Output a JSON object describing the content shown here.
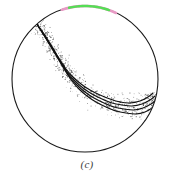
{
  "figure": {
    "caption": "(c)",
    "type": "stereographic-pole-figure",
    "background_color": "#ffffff"
  },
  "boundary_circle": {
    "name": "primitive-circle",
    "center_x": 85,
    "center_y": 79,
    "radius": 73,
    "stroke_color": "#1a1a1a",
    "stroke_width": 1.1,
    "fill_color": "#ffffff"
  },
  "highlight_arc": {
    "name": "top-highlight",
    "green_color": "#55dd55",
    "pink_color": "#e79ac4",
    "start_x": 62,
    "end_x": 116,
    "y": 5.5,
    "stroke_width": 2.4
  },
  "chart_data": {
    "type": "scatter",
    "title": "",
    "subtitle": "",
    "xlabel": "",
    "ylabel": "",
    "grid": false,
    "legend": null,
    "annotations": [
      "(c)"
    ],
    "xlim": [
      12,
      158
    ],
    "ylim": [
      6,
      152
    ],
    "series": [
      {
        "name": "band-1-upper",
        "kind": "line",
        "color": "#111111",
        "width": 1.15,
        "points": [
          [
            31,
            17
          ],
          [
            36,
            23
          ],
          [
            42,
            31
          ],
          [
            48,
            40
          ],
          [
            54,
            50
          ],
          [
            60,
            60
          ],
          [
            66,
            69
          ],
          [
            73,
            77
          ],
          [
            81,
            84
          ],
          [
            90,
            90
          ],
          [
            100,
            95
          ],
          [
            110,
            99
          ],
          [
            120,
            102
          ],
          [
            130,
            103
          ],
          [
            140,
            101
          ],
          [
            148,
            97
          ],
          [
            153,
            93
          ]
        ]
      },
      {
        "name": "band-2",
        "kind": "line",
        "color": "#111111",
        "width": 1.15,
        "points": [
          [
            33,
            19
          ],
          [
            38,
            26
          ],
          [
            44,
            35
          ],
          [
            50,
            44
          ],
          [
            56,
            54
          ],
          [
            62,
            64
          ],
          [
            68,
            73
          ],
          [
            75,
            81
          ],
          [
            83,
            88
          ],
          [
            92,
            94
          ],
          [
            102,
            99
          ],
          [
            112,
            103
          ],
          [
            122,
            105
          ],
          [
            132,
            106
          ],
          [
            142,
            104
          ],
          [
            150,
            100
          ],
          [
            155,
            96
          ]
        ]
      },
      {
        "name": "band-3",
        "kind": "line",
        "color": "#111111",
        "width": 1.15,
        "points": [
          [
            35,
            21
          ],
          [
            40,
            29
          ],
          [
            46,
            38
          ],
          [
            52,
            48
          ],
          [
            58,
            58
          ],
          [
            64,
            68
          ],
          [
            70,
            77
          ],
          [
            77,
            85
          ],
          [
            85,
            92
          ],
          [
            94,
            98
          ],
          [
            104,
            103
          ],
          [
            114,
            107
          ],
          [
            124,
            109
          ],
          [
            134,
            110
          ],
          [
            143,
            108
          ],
          [
            151,
            104
          ],
          [
            156,
            100
          ]
        ]
      },
      {
        "name": "band-4-lower",
        "kind": "line",
        "color": "#111111",
        "width": 1.15,
        "points": [
          [
            37,
            24
          ],
          [
            42,
            32
          ],
          [
            48,
            42
          ],
          [
            54,
            52
          ],
          [
            60,
            62
          ],
          [
            66,
            72
          ],
          [
            72,
            81
          ],
          [
            79,
            89
          ],
          [
            87,
            96
          ],
          [
            96,
            102
          ],
          [
            106,
            107
          ],
          [
            116,
            111
          ],
          [
            126,
            113
          ],
          [
            136,
            114
          ],
          [
            145,
            112
          ],
          [
            152,
            108
          ],
          [
            157,
            104
          ]
        ]
      }
    ],
    "scatter_cloud": {
      "name": "data-point-scatter",
      "color": "#1a1a1a",
      "point_count": 900,
      "point_size": 0.55,
      "spread_px": 9,
      "description": "dense speckle of measured points distributed around the four parallel band curves"
    }
  }
}
